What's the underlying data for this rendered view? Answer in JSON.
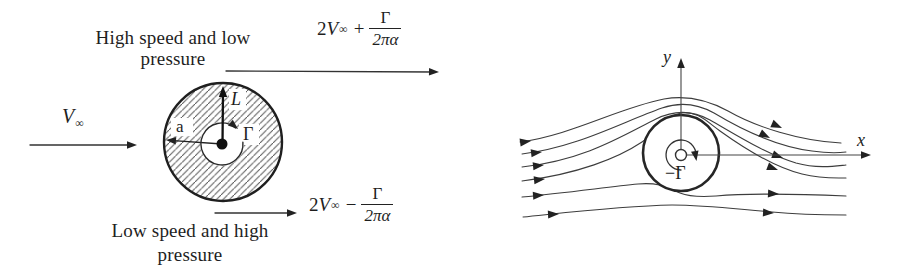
{
  "colors": {
    "ink": "#222222",
    "background": "#ffffff"
  },
  "left_figure": {
    "top_caption": {
      "line1": "High speed and low",
      "line2": "pressure"
    },
    "bottom_caption": {
      "line1": "Low speed and high",
      "line2": "pressure"
    },
    "freestream": {
      "symbol": "V",
      "subscript": "∞"
    },
    "radius_label": "a",
    "lift_label": "L",
    "circulation_label": "Γ",
    "formula_top": {
      "coefficient": "2",
      "symbol": "V",
      "subscript": "∞",
      "operator": "+",
      "numerator": "Γ",
      "denominator": "2πα"
    },
    "formula_bottom": {
      "coefficient": "2",
      "symbol": "V",
      "subscript": "∞",
      "operator": "−",
      "numerator": "Γ",
      "denominator": "2πα"
    }
  },
  "right_figure": {
    "x_axis_label": "x",
    "y_axis_label": "y",
    "circulation_label": "−Γ"
  }
}
